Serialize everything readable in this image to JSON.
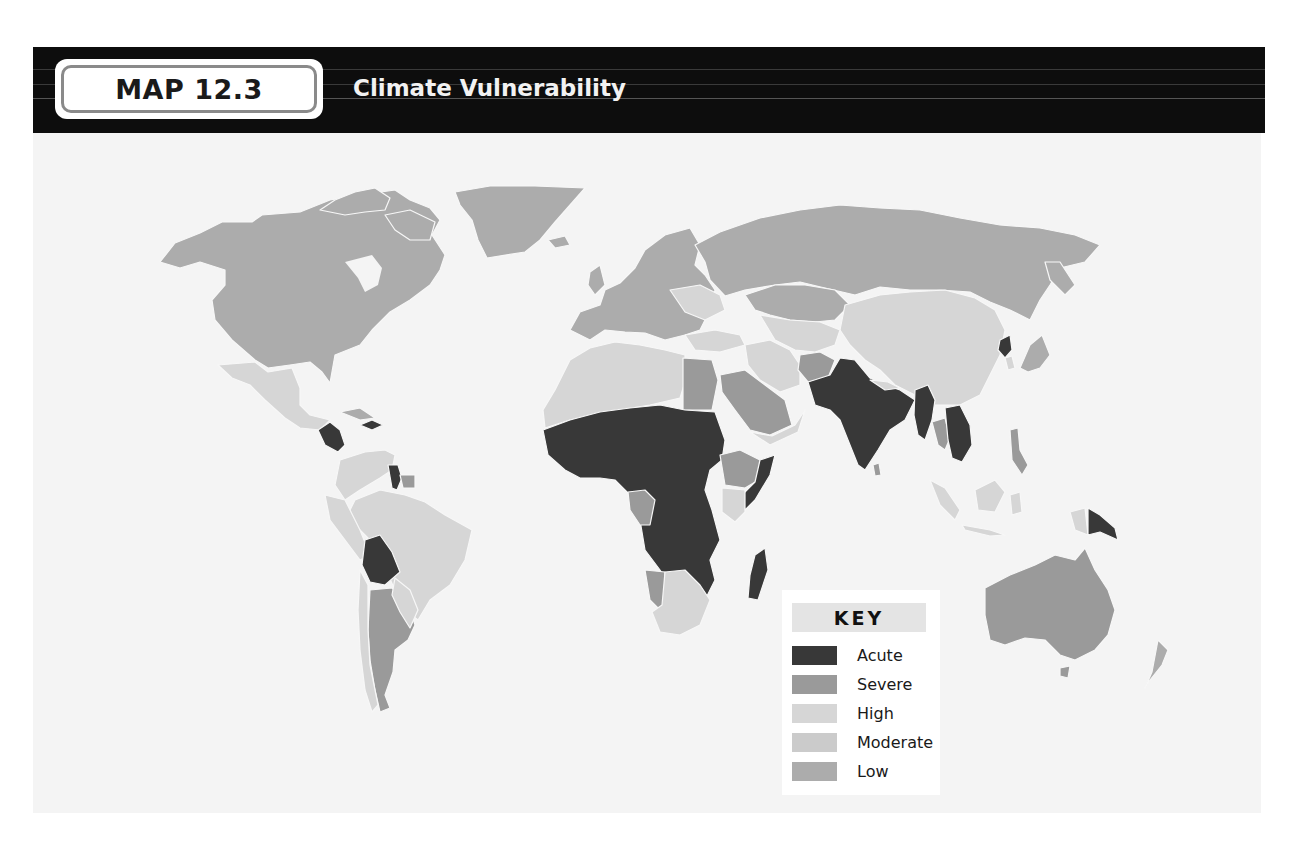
{
  "header": {
    "map_label": "MAP 12.3",
    "title": "Climate Vulnerability"
  },
  "key": {
    "title": "KEY",
    "items": [
      {
        "label": "Acute",
        "color": "#383838"
      },
      {
        "label": "Severe",
        "color": "#9a9a9a"
      },
      {
        "label": "High",
        "color": "#d6d6d6"
      },
      {
        "label": "Moderate",
        "color": "#cbcbcb"
      },
      {
        "label": "Low",
        "color": "#acacac"
      }
    ]
  },
  "colors": {
    "header_bg": "#0d0d0d",
    "panel_bg": "#f4f4f4",
    "border": "#f7f7f7"
  },
  "regions": {
    "north_america": "Low",
    "greenland": "Low",
    "mexico": "High",
    "central_america": "Acute",
    "caribbean_haiti": "Acute",
    "south_america_north": "High",
    "guyana": "Acute",
    "suriname": "Severe",
    "brazil": "High",
    "bolivia": "Acute",
    "argentina": "Severe",
    "chile": "High",
    "europe": "Low",
    "russia": "Low",
    "north_africa": "High",
    "egypt": "Severe",
    "sahel_west_central_africa": "Acute",
    "ethiopia": "Severe",
    "somalia": "Acute",
    "kenya": "High",
    "gabon_congo": "Severe",
    "southern_africa_namibia": "Severe",
    "south_africa": "High",
    "madagascar": "Acute",
    "middle_east": "High",
    "saudi_arabia": "Severe",
    "afghanistan": "Severe",
    "pakistan_india_bangladesh": "Acute",
    "myanmar": "Acute",
    "thailand": "Severe",
    "cambodia_laos": "Acute",
    "china_mongolia": "High",
    "north_korea": "Acute",
    "japan": "Low",
    "indonesia": "High",
    "philippines": "Severe",
    "papua_new_guinea": "Acute",
    "australia": "Severe",
    "new_zealand": "Low"
  }
}
